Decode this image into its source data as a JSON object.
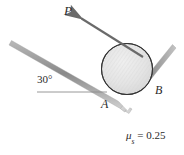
{
  "figure": {
    "type": "mechanics-free-body-diagram",
    "background_color": "#ffffff",
    "line_color": "#6e6e6e",
    "outline_color": "#2b2b2b",
    "cylinder_fill": "#e6e6e6",
    "cylinder_stroke": "#3a3a3a",
    "text_color": "#2b2b2b"
  },
  "labels": {
    "force_P": "P",
    "point_A": "A",
    "point_B": "B",
    "angle": "30°",
    "friction_prefix": "μ",
    "friction_subscript": "s",
    "friction_equals": " = 0.25",
    "friction_full": "μs = 0.25"
  },
  "geometry": {
    "incline_angle_deg": 30,
    "cylinder": {
      "cx": 127,
      "cy": 69,
      "r": 25.5
    },
    "force_arrow": {
      "tail_x": 142,
      "tail_y": 56,
      "tip_x": 79,
      "tip_y": 17
    },
    "incline_line": {
      "x1": 12,
      "y1": 42,
      "x2": 131,
      "y2": 110
    },
    "right_line": {
      "x1": 123,
      "y1": 110,
      "x2": 172,
      "y2": 46
    },
    "horizontal_ref": {
      "x1": 37,
      "y1": 92,
      "x2": 106,
      "y2": 92
    },
    "contact_point_A": {
      "x": 110,
      "y": 92
    },
    "contact_point_B": {
      "x": 151,
      "y": 79
    }
  }
}
